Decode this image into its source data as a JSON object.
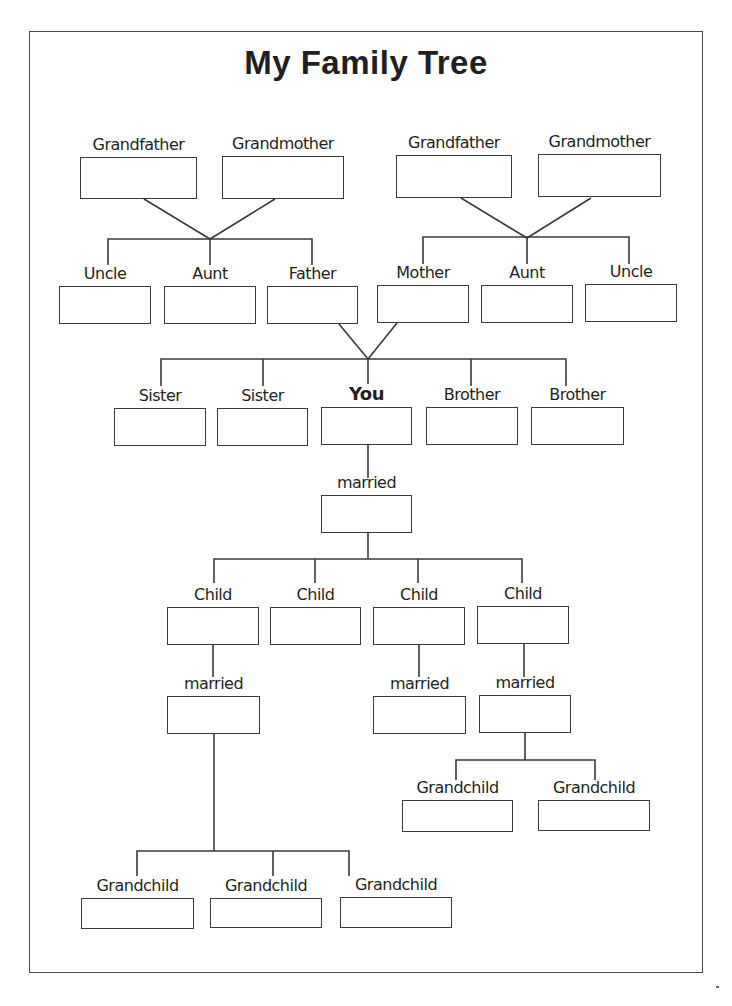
{
  "title": "My Family Tree",
  "nodes": [
    {
      "id": "gf_paternal",
      "label": "Grandfather",
      "x": 80,
      "y": 157,
      "w": 117,
      "h": 42
    },
    {
      "id": "gm_paternal",
      "label": "Grandmother",
      "x": 222,
      "y": 156,
      "w": 122,
      "h": 43
    },
    {
      "id": "gf_maternal",
      "label": "Grandfather",
      "x": 396,
      "y": 155,
      "w": 116,
      "h": 43
    },
    {
      "id": "gm_maternal",
      "label": "Grandmother",
      "x": 538,
      "y": 154,
      "w": 123,
      "h": 43
    },
    {
      "id": "uncle_paternal",
      "label": "Uncle",
      "x": 59,
      "y": 286,
      "w": 92,
      "h": 38
    },
    {
      "id": "aunt_paternal",
      "label": "Aunt",
      "x": 164,
      "y": 286,
      "w": 92,
      "h": 38
    },
    {
      "id": "father",
      "label": "Father",
      "x": 267,
      "y": 286,
      "w": 91,
      "h": 38
    },
    {
      "id": "mother",
      "label": "Mother",
      "x": 377,
      "y": 285,
      "w": 92,
      "h": 38
    },
    {
      "id": "aunt_maternal",
      "label": "Aunt",
      "x": 481,
      "y": 285,
      "w": 92,
      "h": 38
    },
    {
      "id": "uncle_maternal",
      "label": "Uncle",
      "x": 585,
      "y": 284,
      "w": 92,
      "h": 38
    },
    {
      "id": "sister_1",
      "label": "Sister",
      "x": 114,
      "y": 408,
      "w": 92,
      "h": 38
    },
    {
      "id": "sister_2",
      "label": "Sister",
      "x": 217,
      "y": 408,
      "w": 91,
      "h": 38
    },
    {
      "id": "you",
      "label": "You",
      "x": 321,
      "y": 407,
      "w": 91,
      "h": 38,
      "bold": true
    },
    {
      "id": "brother_1",
      "label": "Brother",
      "x": 426,
      "y": 407,
      "w": 92,
      "h": 38
    },
    {
      "id": "brother_2",
      "label": "Brother",
      "x": 531,
      "y": 407,
      "w": 93,
      "h": 38
    },
    {
      "id": "spouse",
      "label": "married",
      "x": 321,
      "y": 495,
      "w": 91,
      "h": 38
    },
    {
      "id": "child_1",
      "label": "Child",
      "x": 167,
      "y": 607,
      "w": 92,
      "h": 38
    },
    {
      "id": "child_2",
      "label": "Child",
      "x": 270,
      "y": 607,
      "w": 91,
      "h": 38
    },
    {
      "id": "child_3",
      "label": "Child",
      "x": 373,
      "y": 607,
      "w": 92,
      "h": 38
    },
    {
      "id": "child_4",
      "label": "Child",
      "x": 477,
      "y": 606,
      "w": 92,
      "h": 38
    },
    {
      "id": "child_1_spouse",
      "label": "married",
      "x": 167,
      "y": 696,
      "w": 93,
      "h": 38
    },
    {
      "id": "child_3_spouse",
      "label": "married",
      "x": 373,
      "y": 696,
      "w": 93,
      "h": 38
    },
    {
      "id": "child_4_spouse",
      "label": "married",
      "x": 479,
      "y": 695,
      "w": 92,
      "h": 38
    },
    {
      "id": "grandchild_4a",
      "label": "Grandchild",
      "x": 402,
      "y": 800,
      "w": 111,
      "h": 32
    },
    {
      "id": "grandchild_4b",
      "label": "Grandchild",
      "x": 538,
      "y": 800,
      "w": 112,
      "h": 31
    },
    {
      "id": "grandchild_1a",
      "label": "Grandchild",
      "x": 81,
      "y": 898,
      "w": 113,
      "h": 31
    },
    {
      "id": "grandchild_1b",
      "label": "Grandchild",
      "x": 210,
      "y": 898,
      "w": 112,
      "h": 30
    },
    {
      "id": "grandchild_1c",
      "label": "Grandchild",
      "x": 340,
      "y": 897,
      "w": 112,
      "h": 31
    }
  ],
  "connectors": [
    "M144,199 L210,239 L275,199",
    "M108,265 L108,239 L312,239 L312,265",
    "M210,239 L210,265",
    "M461,198 L527,238 L591,198",
    "M423,264 L423,237 L629,237 L629,264",
    "M527,238 L527,264",
    "M339,324 L368,359 L397,323",
    "M161,386 L161,359 L566,359 L566,386",
    "M263,359 L263,386",
    "M368,359 L368,384",
    "M471,359 L471,386",
    "M368,445 L368,478",
    "M368,533 L368,559",
    "M214,583 L214,559 L522,559 L522,583",
    "M315,559 L315,583",
    "M418,559 L418,583",
    "M213,645 L213,677",
    "M419,645 L419,677",
    "M524,644 L524,677",
    "M214,734 L214,851",
    "M137,876 L137,851 L349,851 L349,876",
    "M273,851 L273,876",
    "M525,733 L525,760",
    "M456,780 L456,760 L595,760 L595,780"
  ]
}
